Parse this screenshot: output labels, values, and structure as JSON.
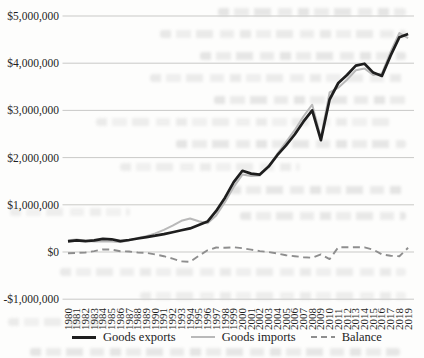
{
  "chart_data": {
    "type": "line",
    "title": "",
    "xlabel": "",
    "ylabel": "",
    "grid": "horizontal",
    "legend_position": "bottom",
    "x": [
      1980,
      1981,
      1982,
      1983,
      1984,
      1985,
      1986,
      1987,
      1988,
      1989,
      1990,
      1991,
      1992,
      1993,
      1994,
      1995,
      1996,
      1997,
      1998,
      1999,
      2000,
      2001,
      2002,
      2003,
      2004,
      2005,
      2006,
      2007,
      2008,
      2009,
      2010,
      2011,
      2012,
      2013,
      2014,
      2015,
      2016,
      2017,
      2018,
      2019
    ],
    "ylim": [
      -1000000,
      5000000
    ],
    "ytick_values": [
      -1000000,
      0,
      1000000,
      2000000,
      3000000,
      4000000,
      5000000
    ],
    "ytick_labels": [
      "-$1,000,000",
      "$0",
      "$1,000,000",
      "$2,000,000",
      "$3,000,000",
      "$4,000,000",
      "$5,000,000"
    ],
    "series": [
      {
        "name": "Goods exports",
        "color": "#1e1e1e",
        "style": "solid",
        "width": 2.7,
        "values": [
          225000,
          245000,
          230000,
          245000,
          280000,
          270000,
          230000,
          255000,
          285000,
          315000,
          345000,
          380000,
          420000,
          460000,
          500000,
          570000,
          645000,
          870000,
          1150000,
          1480000,
          1720000,
          1660000,
          1640000,
          1810000,
          2050000,
          2260000,
          2490000,
          2760000,
          3000000,
          2370000,
          3230000,
          3580000,
          3750000,
          3950000,
          3990000,
          3800000,
          3730000,
          4160000,
          4550000,
          4620000
        ]
      },
      {
        "name": "Goods imports",
        "color": "#b9b9b9",
        "style": "solid",
        "width": 2.0,
        "values": [
          250000,
          265000,
          240000,
          225000,
          225000,
          220000,
          215000,
          245000,
          295000,
          335000,
          395000,
          470000,
          560000,
          660000,
          710000,
          650000,
          610000,
          775000,
          1060000,
          1380000,
          1640000,
          1610000,
          1620000,
          1810000,
          2080000,
          2330000,
          2580000,
          2870000,
          3120000,
          2420000,
          3380000,
          3480000,
          3650000,
          3850000,
          3890000,
          3750000,
          3780000,
          4240000,
          4640000,
          4530000
        ]
      },
      {
        "name": "Balance",
        "color": "#8e8e8e",
        "style": "dashed",
        "width": 1.9,
        "values": [
          -25000,
          -20000,
          -10000,
          20000,
          55000,
          50000,
          15000,
          10000,
          -10000,
          -20000,
          -50000,
          -90000,
          -140000,
          -200000,
          -210000,
          -80000,
          35000,
          95000,
          90000,
          100000,
          80000,
          50000,
          20000,
          0,
          -30000,
          -70000,
          -90000,
          -110000,
          -120000,
          -50000,
          -150000,
          100000,
          100000,
          100000,
          100000,
          50000,
          -50000,
          -80000,
          -90000,
          90000
        ]
      }
    ]
  }
}
